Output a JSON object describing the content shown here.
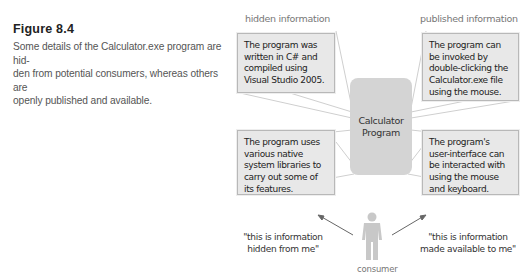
{
  "caption": {
    "title": "Figure 8.4",
    "text": "Some details of the Calculator.exe program are hid-den from potential consumers, whereas others are openly published and available."
  },
  "diagram": {
    "left_heading": "hidden information",
    "right_heading": "published information",
    "center": {
      "line1": "Calculator",
      "line2": "Program"
    },
    "boxes": {
      "top_left": "The program was written in C# and compiled using Visual Studio 2005.",
      "top_right": "The program can be invoked by double-clicking the Calculator.exe file using the mouse.",
      "bottom_left": "The program uses various native system libraries to carry out some of its features.",
      "bottom_right": "The program's user-interface can be interacted with using the mouse and keyboard."
    },
    "quotes": {
      "left": "\"this is information hidden from me\"",
      "right": "\"this is information made available to me\""
    },
    "consumer_label": "consumer"
  },
  "colors": {
    "box_fill": "#e8e8e8",
    "box_border": "#b8b8b8",
    "center_fill": "#d4d4d4",
    "figure_fill": "#c8c8c8",
    "arrow": "#666666"
  }
}
